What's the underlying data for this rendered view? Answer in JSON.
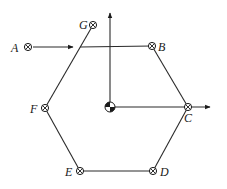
{
  "diagram": {
    "type": "hexagon-path-with-axes",
    "center": {
      "x": 110,
      "y": 107,
      "symbol": "center-of-mass"
    },
    "points": [
      {
        "id": "A",
        "label": "A",
        "x": 28,
        "y": 47,
        "lx": 11,
        "ly": 52
      },
      {
        "id": "G",
        "label": "G",
        "x": 93,
        "y": 25,
        "lx": 79,
        "ly": 29
      },
      {
        "id": "B",
        "label": "B",
        "x": 152,
        "y": 46,
        "lx": 158,
        "ly": 51
      },
      {
        "id": "C",
        "label": "C",
        "x": 188,
        "y": 107,
        "lx": 184,
        "ly": 122
      },
      {
        "id": "D",
        "label": "D",
        "x": 153,
        "y": 171,
        "lx": 160,
        "ly": 176
      },
      {
        "id": "E",
        "label": "E",
        "x": 80,
        "y": 171,
        "lx": 65,
        "ly": 176
      },
      {
        "id": "F",
        "label": "F",
        "x": 45,
        "y": 108,
        "lx": 30,
        "ly": 113
      }
    ],
    "axes": {
      "vertical_arrow_to": {
        "x": 110,
        "y": 12
      },
      "horizontal_arrow_to": {
        "x": 210,
        "y": 107
      }
    },
    "incoming_arrow": {
      "from": "A",
      "to_x": 73,
      "to_y": 47
    }
  }
}
